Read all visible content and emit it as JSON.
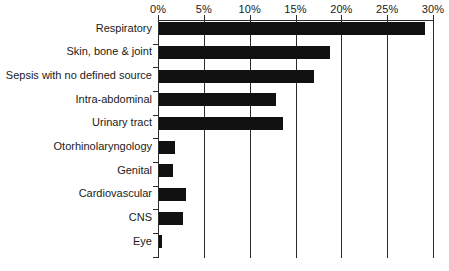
{
  "chart_data": {
    "type": "bar",
    "orientation": "horizontal",
    "title": "",
    "subtitle": "",
    "xlabel": "",
    "ylabel": "",
    "categories": [
      "Respiratory",
      "Skin, bone & joint",
      "Sepsis with no defined source",
      "Intra-abdominal",
      "Urinary tract",
      "Otorhinolaryngology",
      "Genital",
      "Cardiovascular",
      "CNS",
      "Eye"
    ],
    "values": [
      29.0,
      18.7,
      16.9,
      12.8,
      13.5,
      1.7,
      1.5,
      2.9,
      2.6,
      0.3
    ],
    "value_unit": "%",
    "xlim": [
      0,
      30
    ],
    "xtick_labels": [
      "0%",
      "5%",
      "10%",
      "15%",
      "20%",
      "25%",
      "30%"
    ],
    "xtick_values": [
      0,
      5,
      10,
      15,
      20,
      25,
      30
    ],
    "grid": true,
    "grid_axis": "x",
    "legend": null,
    "bar_color": "#111111",
    "axis_color": "#2b2b2b",
    "background_color": "#ffffff",
    "annotations": []
  }
}
